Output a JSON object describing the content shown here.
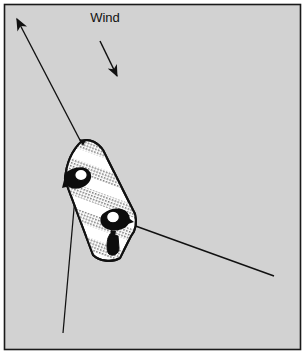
{
  "figure": {
    "width": 305,
    "height": 354,
    "background_color": "#d2d2d2",
    "frame_color": "#1a1a1a",
    "ink_color": "#111111",
    "hull_fill_light": "#ffffff",
    "hull_fill_hatched": "#b9b9b9",
    "figure_fill": "#0d0d0d"
  },
  "labels": {
    "wind": "Wind"
  },
  "annotations": {
    "wind_direction_arrow": {
      "name": "wind-direction-arrow",
      "from": [
        100,
        40
      ],
      "to": [
        118,
        78
      ],
      "description": "short arrow pointing down and to the right indicating wind direction"
    },
    "anchor_rode_arrow": {
      "name": "anchor-rode-arrow",
      "from": [
        82,
        143
      ],
      "to": [
        13,
        11
      ],
      "description": "long line from the bow going up and to the left ending in an arrowhead"
    },
    "port_line": {
      "name": "port-trailing-line",
      "from": [
        79,
        150
      ],
      "to": [
        63,
        333
      ],
      "description": "line running from the port bow down toward the bottom of the frame"
    },
    "stern_line": {
      "name": "stern-trailing-line",
      "from": [
        133,
        226
      ],
      "to": [
        274,
        276
      ],
      "description": "line running from the stern down and to the right"
    }
  },
  "boat": {
    "name": "boat",
    "heading_degrees": 20,
    "bow": [
      82,
      142
    ],
    "stern": [
      121,
      258
    ],
    "stripes": [
      "white",
      "hatched",
      "white",
      "hatched",
      "white",
      "hatched",
      "white",
      "hatched",
      "white"
    ],
    "crew": [
      {
        "name": "crew-figure-bow",
        "position": [
          82,
          176
        ],
        "facing": "port"
      },
      {
        "name": "crew-figure-stern",
        "position": [
          116,
          220
        ],
        "facing": "starboard"
      }
    ],
    "outboard_motor": {
      "name": "outboard-motor",
      "position": [
        113,
        245
      ]
    }
  }
}
